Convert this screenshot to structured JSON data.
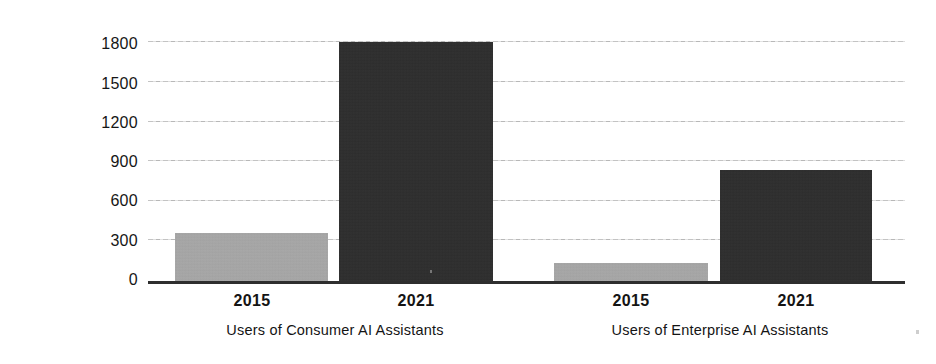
{
  "chart_data": {
    "type": "bar",
    "title": "",
    "xlabel": "",
    "ylabel": "Unique Users (m)",
    "ylim": [
      0,
      1800
    ],
    "yticks": [
      "0",
      "300",
      "600",
      "900",
      "1200",
      "1500",
      "1800"
    ],
    "ytick_values": [
      0,
      300,
      600,
      900,
      1200,
      1500,
      1800
    ],
    "grid": true,
    "legend": "none",
    "categories": [
      "2015",
      "2021"
    ],
    "groups": [
      {
        "label": "Users of Consumer AI Assistants",
        "bars": [
          {
            "category": "2015",
            "value": 380,
            "color": "#a6a6a6"
          },
          {
            "category": "2021",
            "value": 1800,
            "color": "#2d2d2d"
          }
        ]
      },
      {
        "label": "Users of Enterprise AI Assistants",
        "bars": [
          {
            "category": "2015",
            "value": 155,
            "color": "#a6a6a6"
          },
          {
            "category": "2021",
            "value": 850,
            "color": "#2d2d2d"
          }
        ]
      }
    ],
    "colors": {
      "bar_2015": "#a6a6a6",
      "bar_2021": "#2d2d2d",
      "axis": "#2e2e2e",
      "gridline": "#b9b9b9",
      "text": "#141414",
      "background": "#ffffff"
    }
  }
}
